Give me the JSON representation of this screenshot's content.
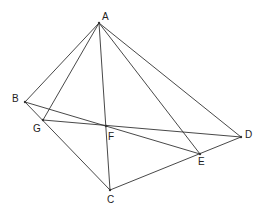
{
  "diagram": {
    "type": "geometry-figure",
    "points": [
      {
        "id": "A",
        "label": "A",
        "x": 99,
        "y": 23,
        "lx": 102,
        "ly": 20
      },
      {
        "id": "B",
        "label": "B",
        "x": 25,
        "y": 102,
        "lx": 12,
        "ly": 102
      },
      {
        "id": "G",
        "label": "G",
        "x": 43,
        "y": 120,
        "lx": 33,
        "ly": 132
      },
      {
        "id": "F",
        "label": "F",
        "x": 106,
        "y": 126,
        "lx": 108,
        "ly": 140
      },
      {
        "id": "D",
        "label": "D",
        "x": 241,
        "y": 137,
        "lx": 245,
        "ly": 138
      },
      {
        "id": "E",
        "label": "E",
        "x": 200,
        "y": 154,
        "lx": 198,
        "ly": 165
      },
      {
        "id": "C",
        "label": "C",
        "x": 110,
        "y": 190,
        "lx": 107,
        "ly": 203
      }
    ],
    "segments": [
      {
        "from": "A",
        "to": "B"
      },
      {
        "from": "A",
        "to": "G"
      },
      {
        "from": "A",
        "to": "C"
      },
      {
        "from": "A",
        "to": "E"
      },
      {
        "from": "A",
        "to": "D"
      },
      {
        "from": "B",
        "to": "E"
      },
      {
        "from": "G",
        "to": "D"
      },
      {
        "from": "B",
        "to": "C"
      },
      {
        "from": "C",
        "to": "D"
      }
    ],
    "line_color": "#333333",
    "background": "#ffffff"
  }
}
